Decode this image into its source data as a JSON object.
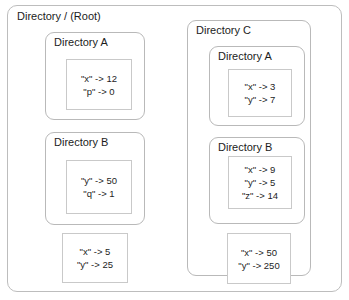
{
  "diagram": {
    "title": "Directory / (Root)",
    "root": {
      "label": "Directory / (Root)",
      "own_frame": {
        "name": "root-frame",
        "bindings": [
          "\"x\" -> 5",
          "\"y\" -> 25"
        ]
      },
      "children": [
        {
          "name": "directory-a",
          "label": "Directory A",
          "frame": {
            "bindings": [
              "\"x\" -> 12",
              "\"p\" -> 0"
            ]
          }
        },
        {
          "name": "directory-b",
          "label": "Directory B",
          "frame": {
            "bindings": [
              "\"y\" -> 50",
              "\"q\" -> 1"
            ]
          }
        },
        {
          "name": "directory-c",
          "label": "Directory C",
          "own_frame": {
            "bindings": [
              "\"x\" -> 50",
              "\"y\" -> 250"
            ]
          },
          "children": [
            {
              "name": "directory-c-a",
              "label": "Directory A",
              "frame": {
                "bindings": [
                  "\"x\" -> 3",
                  "\"y\" -> 7"
                ]
              }
            },
            {
              "name": "directory-c-b",
              "label": "Directory B",
              "frame": {
                "bindings": [
                  "\"x\" -> 9",
                  "\"y\" -> 5",
                  "\"z\" -> 14"
                ]
              }
            }
          ]
        }
      ]
    },
    "colors": {
      "background": "#ffffff",
      "container_border": "#b9b9b9",
      "frame_border": "#c9c9c9",
      "text": "#1c1c1c"
    }
  }
}
